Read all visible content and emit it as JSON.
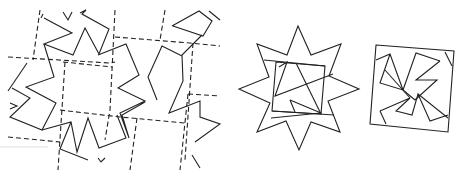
{
  "figure": {
    "panels": [
      {
        "id": "tessellation",
        "label": "star tessellation with dashed square lattice"
      },
      {
        "id": "star",
        "label": "eight-pointed star with inscribed square dissection"
      },
      {
        "id": "square",
        "label": "square assembled from star pieces (pinwheel)"
      }
    ],
    "colors": {
      "stroke": "#222222",
      "background": "#ffffff"
    }
  }
}
